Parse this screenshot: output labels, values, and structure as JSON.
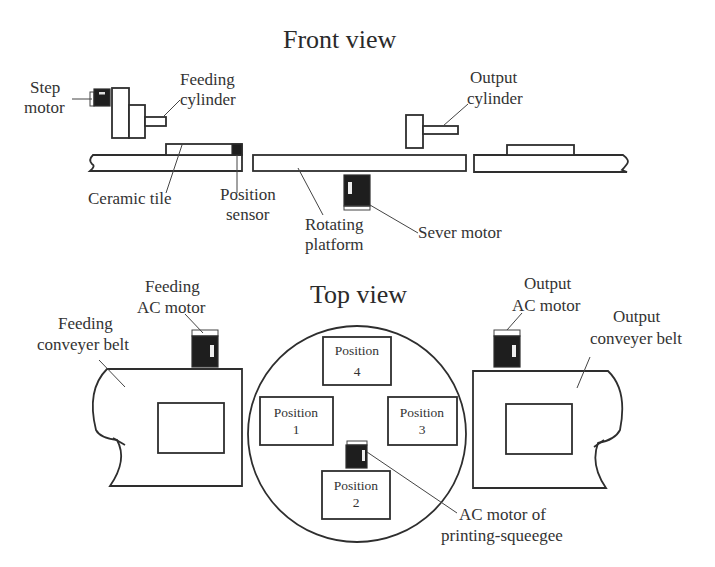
{
  "front_view": {
    "title": "Front view",
    "labels": {
      "step_motor": [
        "Step",
        "motor"
      ],
      "feeding_cylinder": [
        "Feeding",
        "cylinder"
      ],
      "output_cylinder": [
        "Output",
        "cylinder"
      ],
      "ceramic_tile": "Ceramic tile",
      "position_sensor": [
        "Position",
        "sensor"
      ],
      "rotating_platform": [
        "Rotating",
        "platform"
      ],
      "sever_motor": "Sever motor"
    }
  },
  "top_view": {
    "title": "Top view",
    "labels": {
      "feeding_ac_motor": [
        "Feeding",
        "AC motor"
      ],
      "feeding_conveyer_belt": [
        "Feeding",
        "conveyer belt"
      ],
      "output_ac_motor": [
        "Output",
        "AC motor"
      ],
      "output_conveyer_belt": [
        "Output",
        "conveyer belt"
      ],
      "ac_motor_squeegee": [
        "AC motor of",
        "printing-squeegee"
      ]
    },
    "positions": [
      {
        "name": "Position",
        "number": "1"
      },
      {
        "name": "Position",
        "number": "2"
      },
      {
        "name": "Position",
        "number": "3"
      },
      {
        "name": "Position",
        "number": "4"
      }
    ]
  }
}
